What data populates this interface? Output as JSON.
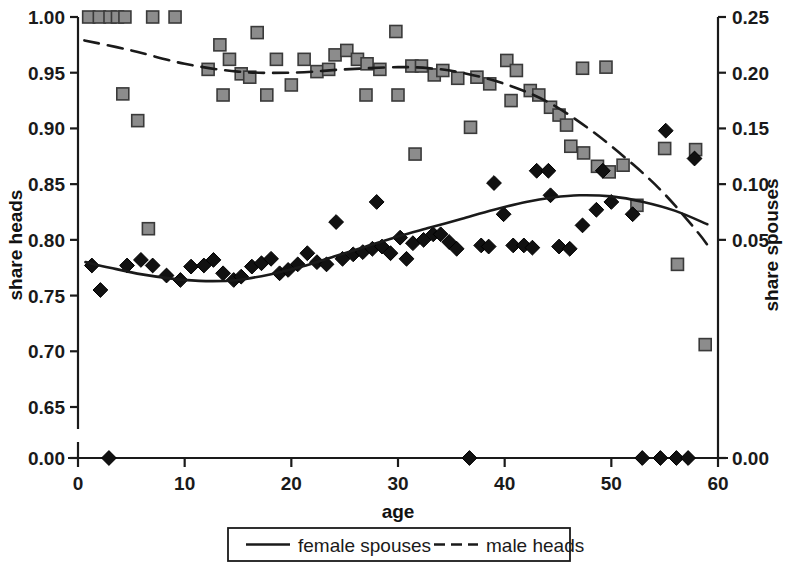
{
  "chart_data": {
    "type": "scatter",
    "title": "",
    "xlabel": "age",
    "ylabel_left": "share heads",
    "ylabel_right": "share spouses",
    "xlim": [
      0,
      60
    ],
    "xticks": [
      0,
      10,
      20,
      30,
      40,
      50,
      60
    ],
    "xticklabels": [
      "0",
      "10",
      "20",
      "30",
      "40",
      "50",
      "60"
    ],
    "left_axis": {
      "label": "share heads",
      "broken": true,
      "ticks": [
        1.0,
        0.95,
        0.9,
        0.85,
        0.8,
        0.75,
        0.7,
        0.65,
        0.0
      ],
      "ticklabels": [
        "1.00",
        "0.95",
        "0.90",
        "0.85",
        "0.80",
        "0.75",
        "0.70",
        "0.65",
        "0.00"
      ]
    },
    "right_axis": {
      "label": "share spouses",
      "ticks": [
        0.25,
        0.2,
        0.15,
        0.1,
        0.05,
        0.0
      ],
      "ticklabels": [
        "0.25",
        "0.20",
        "0.15",
        "0.10",
        "0.05",
        "0.00"
      ]
    },
    "grid": false,
    "legend_position": "bottom-center",
    "series": [
      {
        "name": "male heads",
        "axis": "left",
        "marker": "square",
        "marker_color": "#8c8c8c",
        "marker_edge": "#3a3a3a",
        "line": "dashed",
        "line_color": "#1a1a1a",
        "points": [
          {
            "x": 1,
            "y": 1.0
          },
          {
            "x": 2,
            "y": 1.0
          },
          {
            "x": 3,
            "y": 1.0
          },
          {
            "x": 3.7,
            "y": 1.0
          },
          {
            "x": 4.4,
            "y": 1.0
          },
          {
            "x": 7,
            "y": 1.0
          },
          {
            "x": 9.1,
            "y": 1.0
          },
          {
            "x": 4.2,
            "y": 0.931
          },
          {
            "x": 5.6,
            "y": 0.907
          },
          {
            "x": 6.6,
            "y": 0.81
          },
          {
            "x": 13.3,
            "y": 0.975
          },
          {
            "x": 16.8,
            "y": 0.986
          },
          {
            "x": 14.2,
            "y": 0.962
          },
          {
            "x": 12.2,
            "y": 0.953
          },
          {
            "x": 15.3,
            "y": 0.949
          },
          {
            "x": 16.1,
            "y": 0.946
          },
          {
            "x": 18.6,
            "y": 0.962
          },
          {
            "x": 21.2,
            "y": 0.962
          },
          {
            "x": 24.1,
            "y": 0.966
          },
          {
            "x": 13.6,
            "y": 0.93
          },
          {
            "x": 17.7,
            "y": 0.93
          },
          {
            "x": 20.0,
            "y": 0.939
          },
          {
            "x": 22.4,
            "y": 0.951
          },
          {
            "x": 23.5,
            "y": 0.953
          },
          {
            "x": 25.2,
            "y": 0.97
          },
          {
            "x": 26.2,
            "y": 0.962
          },
          {
            "x": 27.1,
            "y": 0.958
          },
          {
            "x": 28.3,
            "y": 0.953
          },
          {
            "x": 29.8,
            "y": 0.987
          },
          {
            "x": 27.0,
            "y": 0.93
          },
          {
            "x": 30.0,
            "y": 0.93
          },
          {
            "x": 31.3,
            "y": 0.956
          },
          {
            "x": 32.2,
            "y": 0.956
          },
          {
            "x": 33.4,
            "y": 0.948
          },
          {
            "x": 34.2,
            "y": 0.952
          },
          {
            "x": 31.6,
            "y": 0.877
          },
          {
            "x": 35.6,
            "y": 0.945
          },
          {
            "x": 37.4,
            "y": 0.946
          },
          {
            "x": 38.6,
            "y": 0.94
          },
          {
            "x": 36.8,
            "y": 0.901
          },
          {
            "x": 40.2,
            "y": 0.961
          },
          {
            "x": 41.1,
            "y": 0.952
          },
          {
            "x": 42.4,
            "y": 0.934
          },
          {
            "x": 40.6,
            "y": 0.925
          },
          {
            "x": 43.2,
            "y": 0.93
          },
          {
            "x": 44.3,
            "y": 0.919
          },
          {
            "x": 45.1,
            "y": 0.912
          },
          {
            "x": 45.8,
            "y": 0.903
          },
          {
            "x": 46.2,
            "y": 0.884
          },
          {
            "x": 47.3,
            "y": 0.954
          },
          {
            "x": 49.5,
            "y": 0.955
          },
          {
            "x": 47.4,
            "y": 0.878
          },
          {
            "x": 48.7,
            "y": 0.866
          },
          {
            "x": 49.8,
            "y": 0.861
          },
          {
            "x": 51.1,
            "y": 0.867
          },
          {
            "x": 52.4,
            "y": 0.831
          },
          {
            "x": 55.0,
            "y": 0.882
          },
          {
            "x": 57.9,
            "y": 0.881
          },
          {
            "x": 56.2,
            "y": 0.778
          },
          {
            "x": 58.8,
            "y": 0.706
          }
        ],
        "fit_curve": [
          {
            "x": 0.6,
            "y": 0.979
          },
          {
            "x": 5,
            "y": 0.97
          },
          {
            "x": 10,
            "y": 0.958
          },
          {
            "x": 15,
            "y": 0.951
          },
          {
            "x": 20,
            "y": 0.95
          },
          {
            "x": 25,
            "y": 0.953
          },
          {
            "x": 30,
            "y": 0.955
          },
          {
            "x": 33,
            "y": 0.954
          },
          {
            "x": 36,
            "y": 0.95
          },
          {
            "x": 40,
            "y": 0.94
          },
          {
            "x": 44,
            "y": 0.924
          },
          {
            "x": 48,
            "y": 0.899
          },
          {
            "x": 52,
            "y": 0.868
          },
          {
            "x": 55,
            "y": 0.841
          },
          {
            "x": 58,
            "y": 0.808
          },
          {
            "x": 59.2,
            "y": 0.793
          }
        ]
      },
      {
        "name": "female spouses",
        "axis": "right",
        "marker": "diamond",
        "marker_color": "#111111",
        "marker_edge": "#000000",
        "line": "solid",
        "line_color": "#1a1a1a",
        "points": [
          {
            "x": 1.3,
            "y": 0.027
          },
          {
            "x": 2.1,
            "y": 0.005
          },
          {
            "x": 2.9,
            "y": 0.0
          },
          {
            "x": 4.6,
            "y": 0.027
          },
          {
            "x": 5.9,
            "y": 0.032
          },
          {
            "x": 7.0,
            "y": 0.027
          },
          {
            "x": 8.3,
            "y": 0.018
          },
          {
            "x": 9.6,
            "y": 0.014
          },
          {
            "x": 10.6,
            "y": 0.026
          },
          {
            "x": 11.8,
            "y": 0.027
          },
          {
            "x": 12.7,
            "y": 0.032
          },
          {
            "x": 13.6,
            "y": 0.02
          },
          {
            "x": 14.6,
            "y": 0.014
          },
          {
            "x": 15.3,
            "y": 0.017
          },
          {
            "x": 16.3,
            "y": 0.026
          },
          {
            "x": 17.2,
            "y": 0.029
          },
          {
            "x": 18.1,
            "y": 0.033
          },
          {
            "x": 18.9,
            "y": 0.02
          },
          {
            "x": 19.7,
            "y": 0.023
          },
          {
            "x": 20.6,
            "y": 0.028
          },
          {
            "x": 21.5,
            "y": 0.038
          },
          {
            "x": 22.4,
            "y": 0.03
          },
          {
            "x": 23.3,
            "y": 0.028
          },
          {
            "x": 24.2,
            "y": 0.066
          },
          {
            "x": 24.8,
            "y": 0.033
          },
          {
            "x": 25.8,
            "y": 0.037
          },
          {
            "x": 26.7,
            "y": 0.039
          },
          {
            "x": 27.6,
            "y": 0.042
          },
          {
            "x": 28.0,
            "y": 0.084
          },
          {
            "x": 28.5,
            "y": 0.044
          },
          {
            "x": 29.3,
            "y": 0.038
          },
          {
            "x": 30.2,
            "y": 0.052
          },
          {
            "x": 30.8,
            "y": 0.033
          },
          {
            "x": 31.4,
            "y": 0.047
          },
          {
            "x": 32.4,
            "y": 0.05
          },
          {
            "x": 33.3,
            "y": 0.055
          },
          {
            "x": 34.0,
            "y": 0.055
          },
          {
            "x": 34.8,
            "y": 0.048
          },
          {
            "x": 35.5,
            "y": 0.042
          },
          {
            "x": 36.7,
            "y": 0.0
          },
          {
            "x": 37.8,
            "y": 0.045
          },
          {
            "x": 38.5,
            "y": 0.044
          },
          {
            "x": 39.0,
            "y": 0.101
          },
          {
            "x": 39.9,
            "y": 0.073
          },
          {
            "x": 40.8,
            "y": 0.045
          },
          {
            "x": 41.8,
            "y": 0.045
          },
          {
            "x": 42.6,
            "y": 0.043
          },
          {
            "x": 43.0,
            "y": 0.112
          },
          {
            "x": 44.1,
            "y": 0.112
          },
          {
            "x": 44.3,
            "y": 0.09
          },
          {
            "x": 45.1,
            "y": 0.044
          },
          {
            "x": 46.1,
            "y": 0.042
          },
          {
            "x": 47.3,
            "y": 0.063
          },
          {
            "x": 48.6,
            "y": 0.077
          },
          {
            "x": 49.2,
            "y": 0.112
          },
          {
            "x": 50.0,
            "y": 0.084
          },
          {
            "x": 52.0,
            "y": 0.073
          },
          {
            "x": 52.9,
            "y": 0.0
          },
          {
            "x": 54.6,
            "y": 0.0
          },
          {
            "x": 56.1,
            "y": 0.0
          },
          {
            "x": 57.2,
            "y": 0.0
          },
          {
            "x": 55.1,
            "y": 0.148
          },
          {
            "x": 57.8,
            "y": 0.123
          }
        ],
        "fit_curve": [
          {
            "x": 0.7,
            "y": 0.03
          },
          {
            "x": 3,
            "y": 0.025
          },
          {
            "x": 6,
            "y": 0.019
          },
          {
            "x": 9,
            "y": 0.015
          },
          {
            "x": 12,
            "y": 0.013
          },
          {
            "x": 15,
            "y": 0.014
          },
          {
            "x": 18,
            "y": 0.019
          },
          {
            "x": 21,
            "y": 0.026
          },
          {
            "x": 24,
            "y": 0.035
          },
          {
            "x": 27,
            "y": 0.044
          },
          {
            "x": 30,
            "y": 0.053
          },
          {
            "x": 33,
            "y": 0.061
          },
          {
            "x": 36,
            "y": 0.069
          },
          {
            "x": 39,
            "y": 0.077
          },
          {
            "x": 42,
            "y": 0.084
          },
          {
            "x": 44.5,
            "y": 0.088
          },
          {
            "x": 47,
            "y": 0.09
          },
          {
            "x": 50,
            "y": 0.089
          },
          {
            "x": 53,
            "y": 0.084
          },
          {
            "x": 56,
            "y": 0.076
          },
          {
            "x": 59,
            "y": 0.064
          }
        ]
      }
    ]
  },
  "legend": {
    "items": [
      {
        "label": "female spouses",
        "style": "solid"
      },
      {
        "label": "male heads",
        "style": "dashed"
      }
    ]
  }
}
